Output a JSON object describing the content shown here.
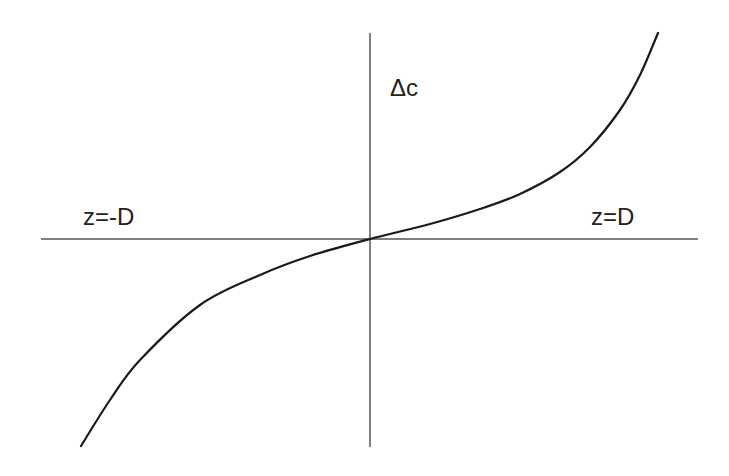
{
  "chart_data": {
    "type": "line",
    "title": "",
    "xlabel": "z",
    "ylabel": "Δc",
    "annotations": [
      "Δc",
      "z=-D",
      "z=D"
    ],
    "x_axis_labels": {
      "left": "z=-D",
      "right": "z=D"
    },
    "y_axis_label": "Δc",
    "grid": false,
    "legend": null,
    "axis_range_x": [
      "-D",
      "D"
    ],
    "x_normalized": [
      -0.88,
      -0.78,
      -0.7,
      -0.52,
      -0.34,
      -0.18,
      0.0,
      0.18,
      0.34,
      0.46,
      0.58,
      0.67,
      0.76,
      0.82,
      0.88
    ],
    "y_normalized": [
      -1.0,
      -0.78,
      -0.58,
      -0.32,
      -0.17,
      -0.08,
      0.0,
      0.07,
      0.145,
      0.22,
      0.32,
      0.44,
      0.62,
      0.79,
      1.0
    ],
    "colors": {
      "curve": "#1a1a1a",
      "axes": "#555555",
      "background": "#ffffff"
    }
  },
  "labels": {
    "y_axis": "Δc",
    "x_left": "z=-D",
    "x_right": "z=D"
  },
  "geometry": {
    "origin": [
      370,
      239
    ],
    "x_axis": [
      41,
      698
    ],
    "y_axis": [
      33,
      447
    ],
    "curve_points": [
      [
        81,
        446
      ],
      [
        110,
        400
      ],
      [
        140,
        360
      ],
      [
        200,
        305
      ],
      [
        260,
        275
      ],
      [
        310,
        256
      ],
      [
        370,
        239
      ],
      [
        430,
        224
      ],
      [
        480,
        209
      ],
      [
        520,
        194
      ],
      [
        560,
        172
      ],
      [
        590,
        147
      ],
      [
        620,
        110
      ],
      [
        640,
        75
      ],
      [
        658,
        33
      ]
    ]
  }
}
